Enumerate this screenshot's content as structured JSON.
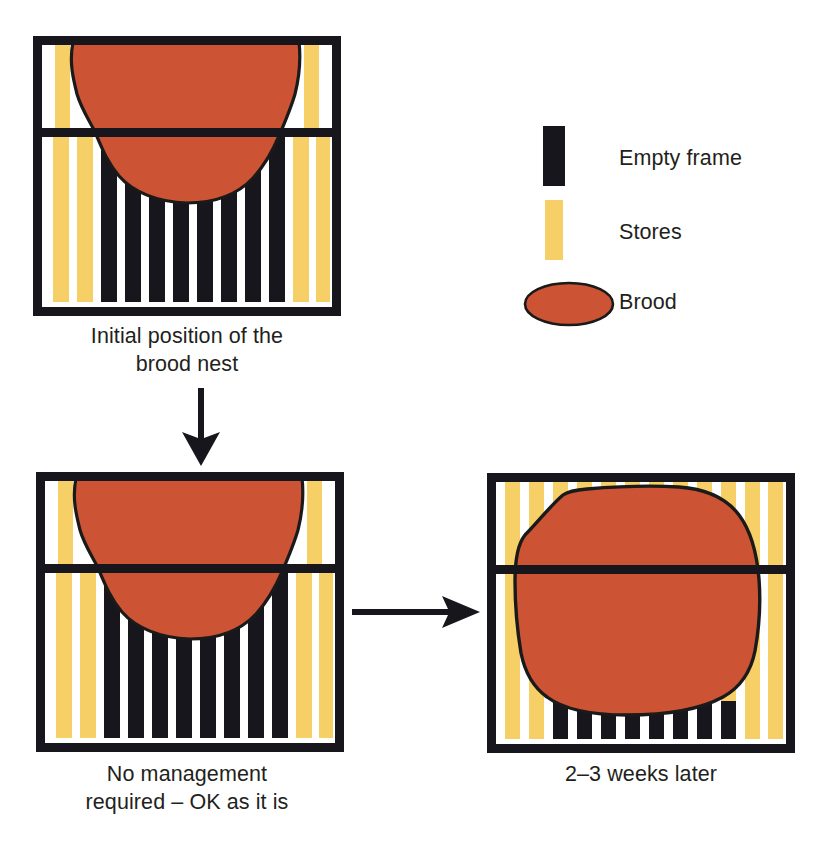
{
  "figure": {
    "colors": {
      "brood": "#cc5334",
      "brood_stroke": "#1a1a1a",
      "stores": "#f6d066",
      "empty_frame": "#17161c",
      "frame_outline": "#17161c",
      "background": "#ffffff",
      "text": "#231f20"
    }
  },
  "legend": {
    "items": [
      {
        "id": "empty-frame",
        "label": "Empty frame",
        "swatch": "bar",
        "color": "#17161c"
      },
      {
        "id": "stores",
        "label": "Stores",
        "swatch": "bar",
        "color": "#f6d066"
      },
      {
        "id": "brood",
        "label": "Brood",
        "swatch": "ellipse",
        "color": "#cc5334"
      }
    ]
  },
  "panels": [
    {
      "id": "panel-initial",
      "caption": "Initial position of the\nbrood nest",
      "upper_box_frames": [
        "stores",
        "empty",
        "empty",
        "empty",
        "empty",
        "empty",
        "empty",
        "empty",
        "empty",
        "empty",
        "empty",
        "stores"
      ],
      "lower_box_frames": [
        "stores",
        "stores",
        "empty-frame",
        "empty-frame",
        "empty-frame",
        "empty-frame",
        "empty-frame",
        "empty-frame",
        "empty-frame",
        "empty-frame",
        "stores",
        "stores"
      ],
      "brood_description": "Brood nest fills the upper box and dips into the top-centre of the lower box"
    },
    {
      "id": "panel-no-management",
      "caption": "No management\nrequired – OK as it is",
      "upper_box_frames": [
        "stores",
        "empty",
        "empty",
        "empty",
        "empty",
        "empty",
        "empty",
        "empty",
        "empty",
        "empty",
        "empty",
        "stores"
      ],
      "lower_box_frames": [
        "stores",
        "stores",
        "empty-frame",
        "empty-frame",
        "empty-frame",
        "empty-frame",
        "empty-frame",
        "empty-frame",
        "empty-frame",
        "empty-frame",
        "stores",
        "stores"
      ],
      "brood_description": "Brood nest fills the upper box and dips into the top-centre of the lower box"
    },
    {
      "id": "panel-later",
      "caption": "2–3 weeks later",
      "upper_box_frames": [
        "stores",
        "stores",
        "stores",
        "stores",
        "stores",
        "stores",
        "stores",
        "stores",
        "stores",
        "stores",
        "stores",
        "stores"
      ],
      "lower_box_frames": [
        "stores",
        "stores",
        "stores",
        "stores",
        "stores",
        "stores",
        "stores",
        "stores",
        "stores",
        "stores",
        "stores",
        "stores"
      ],
      "brood_description": "Enlarged brood nest occupies nearly both boxes, with a row of empty frames visible along the bottom"
    }
  ],
  "arrows": [
    {
      "id": "arrow-down",
      "direction": "down",
      "from": "panel-initial",
      "to": "panel-no-management"
    },
    {
      "id": "arrow-right",
      "direction": "right",
      "from": "panel-no-management",
      "to": "panel-later"
    }
  ]
}
